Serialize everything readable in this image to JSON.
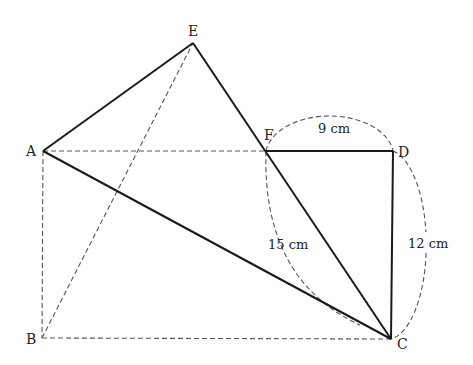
{
  "diagram": {
    "points": {
      "A": {
        "label": "A",
        "x": 43,
        "y": 151
      },
      "B": {
        "label": "B",
        "x": 42,
        "y": 338
      },
      "C": {
        "label": "C",
        "x": 391,
        "y": 339
      },
      "D": {
        "label": "D",
        "x": 393,
        "y": 151
      },
      "E": {
        "label": "E",
        "x": 193,
        "y": 43
      },
      "F": {
        "label": "F",
        "x": 266,
        "y": 151
      }
    },
    "measurements": {
      "FD": "9 cm",
      "DC": "12 cm",
      "FC": "15 cm"
    }
  }
}
